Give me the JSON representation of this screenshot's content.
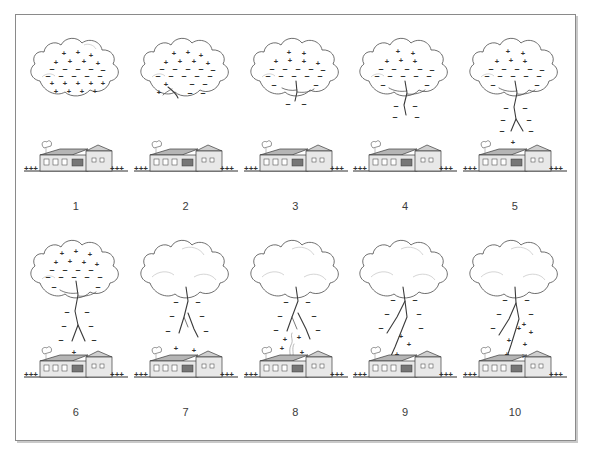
{
  "figure": {
    "panel_count": 10,
    "rows": 2,
    "columns": 5,
    "border_color": "#8a8a8a",
    "background_color": "#ffffff"
  },
  "symbols": {
    "positive": "+",
    "negative": "–",
    "ground_charge_group": "+++"
  },
  "scene_elements": {
    "cloud_label": "thundercloud",
    "house_label": "house-with-chimney",
    "ground_label": "ground-line",
    "leader_label": "stepped-leader",
    "streamer_label": "upward-streamer"
  },
  "panels": [
    {
      "number": "1",
      "cloud_positive_top": true,
      "cloud_negative_middle": true,
      "cloud_positive_bottom": true,
      "leader_stage": 0,
      "house_positive_marks": 0,
      "streamer": false,
      "description": "Charge separation in cloud: positive top, negative middle, positive pocket at base."
    },
    {
      "number": "2",
      "cloud_positive_top": true,
      "cloud_negative_middle": true,
      "cloud_positive_bottom": true,
      "leader_stage": 1,
      "house_positive_marks": 0,
      "streamer": false,
      "description": "Stepped leader begins inside cloud base."
    },
    {
      "number": "3",
      "cloud_positive_top": true,
      "cloud_negative_middle": true,
      "cloud_positive_bottom": false,
      "leader_stage": 2,
      "house_positive_marks": 0,
      "streamer": false,
      "description": "Leader emerges just below cloud base with negative charge."
    },
    {
      "number": "4",
      "cloud_positive_top": true,
      "cloud_negative_middle": true,
      "cloud_positive_bottom": false,
      "leader_stage": 3,
      "house_positive_marks": 0,
      "streamer": false,
      "description": "Leader extends downward in steps."
    },
    {
      "number": "5",
      "cloud_positive_top": true,
      "cloud_negative_middle": true,
      "cloud_positive_bottom": false,
      "leader_stage": 4,
      "house_positive_marks": 1,
      "streamer": false,
      "description": "Leader branches; positive charge builds above the house."
    },
    {
      "number": "6",
      "cloud_positive_top": true,
      "cloud_negative_middle": true,
      "cloud_positive_bottom": false,
      "leader_stage": 5,
      "house_positive_marks": 1,
      "streamer": false,
      "description": "Leader descends further with branching tips."
    },
    {
      "number": "7",
      "cloud_positive_top": false,
      "cloud_negative_middle": false,
      "cloud_positive_bottom": false,
      "leader_stage": 6,
      "house_positive_marks": 2,
      "streamer": false,
      "description": "Leader nears ground; positive charge concentrates on the house."
    },
    {
      "number": "8",
      "cloud_positive_top": false,
      "cloud_negative_middle": false,
      "cloud_positive_bottom": false,
      "leader_stage": 7,
      "house_positive_marks": 4,
      "streamer": true,
      "description": "Upward positive streamer rises from the chimney toward the leader."
    },
    {
      "number": "9",
      "cloud_positive_top": false,
      "cloud_negative_middle": false,
      "cloud_positive_bottom": false,
      "leader_stage": 8,
      "house_positive_marks": 3,
      "streamer": false,
      "description": "Streamer and leader connect; channel attaches to the house."
    },
    {
      "number": "10",
      "cloud_positive_top": false,
      "cloud_negative_middle": false,
      "cloud_positive_bottom": false,
      "leader_stage": 9,
      "house_positive_marks": 4,
      "streamer": false,
      "description": "Return stroke: full lightning channel from cloud to house."
    }
  ]
}
